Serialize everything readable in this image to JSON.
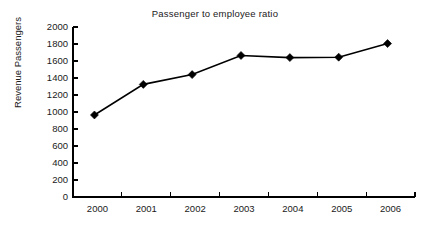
{
  "chart_data": {
    "type": "line",
    "title": "Passenger to employee ratio",
    "xlabel": "",
    "ylabel": "Revenue Passengers",
    "categories": [
      "2000",
      "2001",
      "2002",
      "2003",
      "2004",
      "2005",
      "2006"
    ],
    "x": [
      2000,
      2001,
      2002,
      2003,
      2004,
      2005,
      2006
    ],
    "values": [
      965,
      1325,
      1440,
      1665,
      1640,
      1645,
      1805
    ],
    "series": [
      {
        "name": "Revenue Passengers",
        "values": [
          965,
          1325,
          1440,
          1665,
          1640,
          1645,
          1805
        ]
      }
    ],
    "ylim": [
      0,
      2000
    ],
    "y_ticks": [
      0,
      200,
      400,
      600,
      800,
      1000,
      1200,
      1400,
      1600,
      1800,
      2000
    ],
    "y_tick_labels": [
      "0",
      "200",
      "400",
      "600",
      "800",
      "1000",
      "1200",
      "1400",
      "1600",
      "1800",
      "2000"
    ],
    "x_tick_labels": [
      "2000",
      "2001",
      "2002",
      "2003",
      "2004",
      "2005",
      "2006"
    ],
    "grid": false,
    "legend": false,
    "legend_position": "none",
    "marker": "diamond",
    "line_color": "#000000",
    "marker_color": "#000000",
    "background_color": "#ffffff",
    "axis_color": "#000000"
  }
}
